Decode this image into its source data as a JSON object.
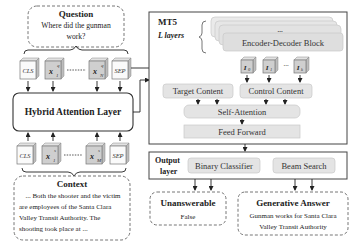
{
  "question": {
    "title": "Question",
    "text_line1": "Where did the gunman",
    "text_line2": "work?"
  },
  "question_tokens": [
    {
      "label": "CLS",
      "kind": "special"
    },
    {
      "label": "x",
      "sub": "1",
      "sup": "q",
      "kind": "token"
    },
    {
      "label": "x",
      "sub": "N",
      "sup": "q",
      "kind": "token"
    },
    {
      "label": "SEP",
      "kind": "special"
    }
  ],
  "hybrid_attention": {
    "label": "Hybrid Attention Layer"
  },
  "context_tokens": [
    {
      "label": "CLS",
      "kind": "special"
    },
    {
      "label": "x",
      "sub": "1",
      "sup": "s",
      "kind": "token"
    },
    {
      "label": "x",
      "sub": "M",
      "sup": "s",
      "kind": "token"
    },
    {
      "label": "SEP",
      "kind": "special"
    }
  ],
  "context": {
    "title": "Context",
    "lines": [
      "... Both the shooter and the victim",
      "are employees of the Santa Clara",
      "Valley Transit Authority. The",
      "shooting took place at ..."
    ]
  },
  "mt5": {
    "title": "MT5",
    "layers_label": "L layers",
    "block_ellipsis": "...",
    "block_label": "Encoder-Decoder Block",
    "control_tokens": [
      {
        "label": "I",
        "sub": "0"
      },
      {
        "label": "I",
        "sub": "1"
      },
      {
        "label": "I",
        "sub": "k"
      }
    ],
    "control_ellipsis": "...",
    "target_content": "Target Content",
    "control_content": "Control Content",
    "self_attention": "Self-Attention",
    "feed_forward": "Feed Forward"
  },
  "output_layer": {
    "title_line1": "Output",
    "title_line2": "layer",
    "binary_classifier": "Binary Classifier",
    "beam_search": "Beam Search"
  },
  "unanswerable": {
    "title": "Unanswerable",
    "value": "False"
  },
  "generative_answer": {
    "title": "Generative Answer",
    "line1": "Gunman works for Santa Clara",
    "line2": "Valley Transit Authority"
  }
}
